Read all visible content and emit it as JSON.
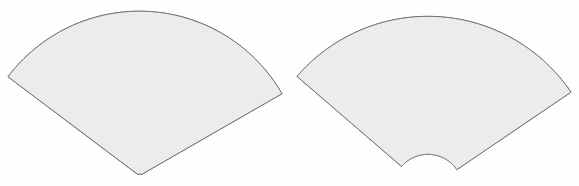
{
  "figure": {
    "background_color": "#fefefe",
    "width": 579,
    "height": 186,
    "panel_count": 2
  },
  "style": {
    "land_color": "#a8a8a8",
    "ocean_color": "#ececec",
    "coast_color": "#2b2b2b",
    "graticule_color": "#8e8e8e",
    "frame_color": "#6a6a6a",
    "islet_color": "#777777"
  },
  "panels": [
    {
      "id": "left",
      "name": "tangent-conic-map",
      "projection": "Lambert Conformal Conic (tangent, pole at apex)",
      "apex_visible": true,
      "caption": "",
      "graticule": {
        "meridian_step_deg": 10,
        "parallel_step_deg": 10,
        "lon_min_deg": -170,
        "lon_max_deg": -10,
        "lat_min_deg": 0,
        "lat_max_deg": 90,
        "grid_on": true
      },
      "center": {
        "lon_deg": -95,
        "lat_deg": 45
      },
      "standard_parallels_deg": [
        45,
        45
      ],
      "apex_px": {
        "x": 145,
        "y": 10
      }
    },
    {
      "id": "right",
      "name": "secant-conic-map",
      "projection": "Lambert Conformal Conic (secant, apex above frame)",
      "apex_visible": false,
      "caption": "",
      "graticule": {
        "meridian_step_deg": 10,
        "parallel_step_deg": 10,
        "lon_min_deg": -170,
        "lon_max_deg": -10,
        "lat_min_deg": 0,
        "lat_max_deg": 80,
        "grid_on": true
      },
      "center": {
        "lon_deg": -95,
        "lat_deg": 45
      },
      "standard_parallels_deg": [
        20,
        60
      ],
      "apex_px": {
        "x": 434,
        "y": -40
      }
    }
  ],
  "features": {
    "landmasses": [
      "North America mainland",
      "Greenland",
      "Canadian Arctic Archipelago",
      "Alaska",
      "Mexico",
      "Central America",
      "Caribbean islands",
      "northern South America",
      "Iceland",
      "western Europe / northwest Africa edge"
    ],
    "lakes": [
      "Great Lakes",
      "Hudson Bay"
    ],
    "islets": [
      "Hawaii",
      "Bermuda"
    ]
  }
}
